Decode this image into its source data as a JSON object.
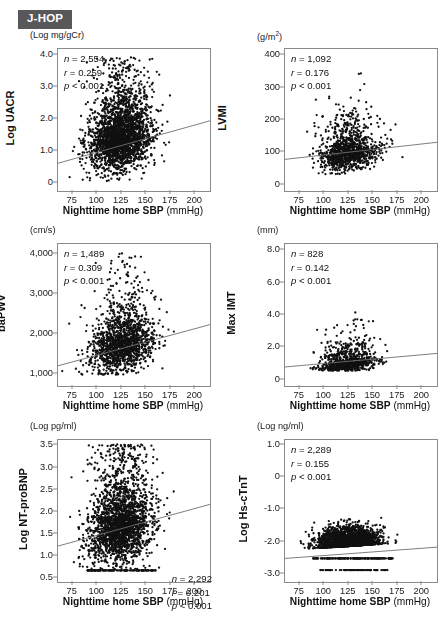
{
  "study": {
    "badge_label": "J-HOP"
  },
  "shared": {
    "x_axis_title_main": "Nighttime home SBP",
    "x_axis_title_unit": "(mmHg)",
    "x_ticks": [
      "75",
      "100",
      "125",
      "150",
      "175",
      "200"
    ],
    "x_tick_values": [
      75,
      100,
      125,
      150,
      175,
      200
    ],
    "x_range": [
      60,
      215
    ]
  },
  "chart_data": [
    {
      "id": "uacr",
      "type": "scatter",
      "title": "",
      "unit_label": "(Log mg/gCr)",
      "ylabel": "Log UACR",
      "xlabel": "Nighttime home SBP (mmHg)",
      "y_ticks": [
        "4.0",
        "3.0",
        "2.0",
        "1.0",
        "0"
      ],
      "y_tick_values": [
        4.0,
        3.0,
        2.0,
        1.0,
        0
      ],
      "ylim": [
        -0.25,
        4.2
      ],
      "xlim": [
        60,
        215
      ],
      "grid": false,
      "stats_position": "top-left",
      "n_label": "n = 2,554",
      "r_label": "r = 0.259",
      "p_label": "p < 0.001",
      "n": 2554,
      "r": 0.259,
      "p": "<0.001",
      "fit_line": {
        "x1": 60,
        "y1": 0.62,
        "x2": 215,
        "y2": 1.95
      },
      "cloud": {
        "x_mean": 124,
        "x_sd": 16,
        "y_mean": 1.45,
        "y_sd": 0.48,
        "y_skew": 0.55,
        "y_floor": 0.05,
        "y_cap": 3.95
      }
    },
    {
      "id": "lvmi",
      "type": "scatter",
      "title": "",
      "unit_label": "(g/m2)",
      "unit_label_html": "(g/m<sup>2</sup>)",
      "ylabel": "LVMI",
      "xlabel": "Nighttime home SBP (mmHg)",
      "y_ticks": [
        "400",
        "300",
        "200",
        "100",
        "0"
      ],
      "y_tick_values": [
        400,
        300,
        200,
        100,
        0
      ],
      "ylim": [
        -20,
        420
      ],
      "xlim": [
        60,
        215
      ],
      "grid": false,
      "stats_position": "top-left",
      "n_label": "n = 1,092",
      "r_label": "r = 0.176",
      "p_label": "p < 0.001",
      "n": 1092,
      "r": 0.176,
      "p": "<0.001",
      "fit_line": {
        "x1": 60,
        "y1": 78,
        "x2": 215,
        "y2": 131
      },
      "cloud": {
        "x_mean": 125,
        "x_sd": 15,
        "y_mean": 102,
        "y_sd": 26,
        "y_skew": 0.75,
        "y_floor": 32,
        "y_cap": 345
      }
    },
    {
      "id": "bapwv",
      "type": "scatter",
      "title": "",
      "unit_label": "(cm/s)",
      "ylabel": "baPWV",
      "xlabel": "Nighttime home SBP (mmHg)",
      "y_ticks": [
        "4,000",
        "3,000",
        "2,000",
        "1,000"
      ],
      "y_tick_values": [
        4000,
        3000,
        2000,
        1000
      ],
      "ylim": [
        700,
        4250
      ],
      "xlim": [
        60,
        215
      ],
      "grid": false,
      "stats_position": "top-left",
      "n_label": "n = 1,489",
      "r_label": "r = 0.309",
      "p_label": "p < 0.001",
      "n": 1489,
      "r": 0.309,
      "p": "<0.001",
      "fit_line": {
        "x1": 60,
        "y1": 1205,
        "x2": 215,
        "y2": 2235
      },
      "cloud": {
        "x_mean": 126,
        "x_sd": 16,
        "y_mean": 1760,
        "y_sd": 330,
        "y_skew": 0.6,
        "y_floor": 980,
        "y_cap": 4020
      }
    },
    {
      "id": "maximt",
      "type": "scatter",
      "title": "",
      "unit_label": "(mm)",
      "ylabel": "Max IMT",
      "xlabel": "Nighttime home SBP (mmHg)",
      "y_ticks": [
        "8.0",
        "6.0",
        "4.0",
        "2.0",
        "0"
      ],
      "y_tick_values": [
        8.0,
        6.0,
        4.0,
        2.0,
        0
      ],
      "ylim": [
        -0.4,
        8.4
      ],
      "xlim": [
        60,
        215
      ],
      "grid": false,
      "stats_position": "top-left",
      "n_label": "n = 828",
      "r_label": "r = 0.142",
      "p_label": "p < 0.001",
      "n": 828,
      "r": 0.142,
      "p": "<0.001",
      "fit_line": {
        "x1": 60,
        "y1": 0.78,
        "x2": 215,
        "y2": 1.62
      },
      "cloud": {
        "x_mean": 125,
        "x_sd": 14,
        "y_mean": 1.05,
        "y_sd": 0.28,
        "y_skew": 1.1,
        "y_floor": 0.55,
        "y_cap": 7.85
      }
    },
    {
      "id": "ntprobnp",
      "type": "scatter",
      "title": "",
      "unit_label": "(Log pg/ml)",
      "ylabel": "Log NT-proBNP",
      "xlabel": "Nighttime home SBP (mmHg)",
      "y_ticks": [
        "3.5",
        "3.0",
        "2.5",
        "2.0",
        "1.5",
        "1.0",
        "0.5"
      ],
      "y_tick_values": [
        3.5,
        3.0,
        2.5,
        2.0,
        1.5,
        1.0,
        0.5
      ],
      "ylim": [
        0.42,
        3.62
      ],
      "xlim": [
        60,
        215
      ],
      "grid": false,
      "stats_position": "bottom-right",
      "n_label": "n = 2,292",
      "r_label": "r = 0.201",
      "p_label": "p < 0.001",
      "n": 2292,
      "r": 0.201,
      "p": "<0.001",
      "fit_line": {
        "x1": 60,
        "y1": 1.23,
        "x2": 215,
        "y2": 2.17
      },
      "cloud": {
        "x_mean": 124,
        "x_sd": 16,
        "y_mean": 1.75,
        "y_sd": 0.42,
        "y_skew": 0.5,
        "y_floor": 0.68,
        "y_cap": 3.52
      },
      "floor_band": {
        "y": 0.68,
        "x_from": 90,
        "x_to": 160,
        "count": 120
      }
    },
    {
      "id": "hscTnT",
      "type": "scatter",
      "title": "",
      "unit_label": "(Log ng/ml)",
      "ylabel": "Log Hs-cTnT",
      "xlabel": "Nighttime home SBP (mmHg)",
      "y_ticks": [
        "1.0",
        "0",
        "-1.0",
        "-2.0",
        "-3.0"
      ],
      "y_tick_values": [
        1.0,
        0,
        -1.0,
        -2.0,
        -3.0
      ],
      "ylim": [
        -3.25,
        1.15
      ],
      "xlim": [
        60,
        215
      ],
      "grid": false,
      "stats_position": "top-left",
      "n_label": "n = 2,289",
      "r_label": "r = 0.155",
      "p_label": "p < 0.001",
      "n": 2289,
      "r": 0.155,
      "p": "<0.001",
      "fit_line": {
        "x1": 60,
        "y1": -2.52,
        "x2": 215,
        "y2": -2.17
      },
      "cloud": {
        "x_mean": 124,
        "x_sd": 15,
        "y_mean": -2.02,
        "y_sd": 0.24,
        "y_skew": -0.5,
        "y_floor": -2.48,
        "y_cap": 0.06
      },
      "floor_band": {
        "y": -2.52,
        "x_from": 88,
        "x_to": 170,
        "count": 150
      },
      "floor_band2": {
        "y": -2.88,
        "x_from": 95,
        "x_to": 165,
        "count": 70
      }
    }
  ]
}
